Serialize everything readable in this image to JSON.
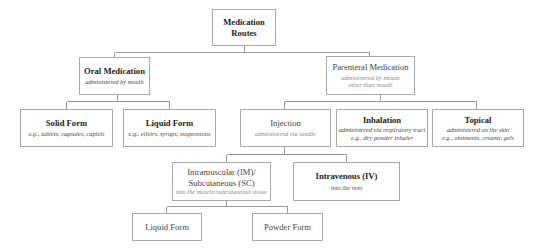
{
  "diagram": {
    "title": "Medication Routes",
    "root": {
      "title_line1": "Medication",
      "title_line2": "Routes"
    },
    "oral": {
      "title": "Oral Medication",
      "subtitle": "administered by mouth"
    },
    "parenteral": {
      "title": "Parenteral Medication",
      "subtitle_line1": "administered by means",
      "subtitle_line2": "other than mouth"
    },
    "solid": {
      "title": "Solid Form",
      "subtitle": "e.g., tablets, capsules, caplets"
    },
    "liquid": {
      "title": "Liquid Form",
      "subtitle": "e.g., elixirs, syrups, suspensions"
    },
    "injection": {
      "title": "Injection",
      "subtitle": "administered via needle"
    },
    "inhalation": {
      "title": "Inhalation",
      "subtitle_line1": "administered via respiratory tract",
      "subtitle_line2": "e.g., dry powder inhaler"
    },
    "topical": {
      "title": "Topical",
      "subtitle_line1": "administered on the skin",
      "subtitle_line2": "e.g., ointments, creams, gels"
    },
    "im_sc": {
      "title_line1": "Intramuscular (IM)/",
      "title_line2": "Subcutaneous (SC)",
      "subtitle": "into the muscle/subcutaneous tissue"
    },
    "iv": {
      "title": "Intravenous (IV)",
      "subtitle": "into the vein"
    },
    "inj_liquid": {
      "title": "Liquid Form"
    },
    "inj_powder": {
      "title": "Powder Form"
    }
  },
  "colors": {
    "border": "#a9a9a9",
    "connector": "#9a9a9a",
    "text": "#222222",
    "subtext": "#444444"
  }
}
